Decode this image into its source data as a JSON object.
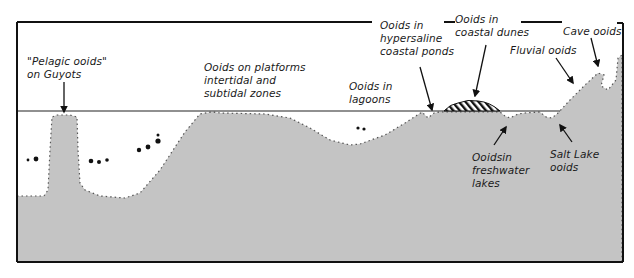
{
  "diagram": {
    "type": "cross-section",
    "colors": {
      "substrate": "#c4c4c4",
      "outline": "#111111",
      "water_background": "#ffffff",
      "sea_level_line": "#222222"
    },
    "labels": {
      "pelagic": "\"Pelagic ooids\"\non Guyots",
      "platforms": "Ooids on platforms\nintertidal and\nsubtidal zones",
      "lagoons": "Ooids in\nlagoons",
      "hypersaline": "Ooids in\nhypersaline\ncoastal ponds",
      "dunes": "Ooids in\ncoastal dunes",
      "cave": "Cave ooids",
      "fluvial": "Fluvial ooids",
      "freshwater": "Ooidsin\nfreshwater\nlakes",
      "salt_lake": "Salt Lake\nooids"
    },
    "caption": ""
  }
}
